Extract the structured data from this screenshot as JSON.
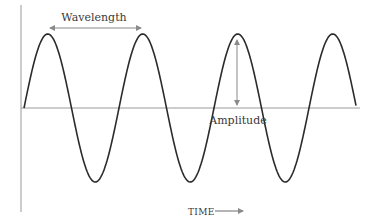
{
  "diagram": {
    "labels": {
      "wavelength": "Wavelength",
      "amplitude": "Amplitude",
      "time_axis": "TIME"
    },
    "colors": {
      "wave": "#2b2b2b",
      "axes": "#8a8a8a",
      "arrows": "#8a8a8a",
      "text": "#3a3a3a"
    },
    "wave": {
      "cycles": 3.5,
      "peaks": 4,
      "troughs": 3
    }
  }
}
